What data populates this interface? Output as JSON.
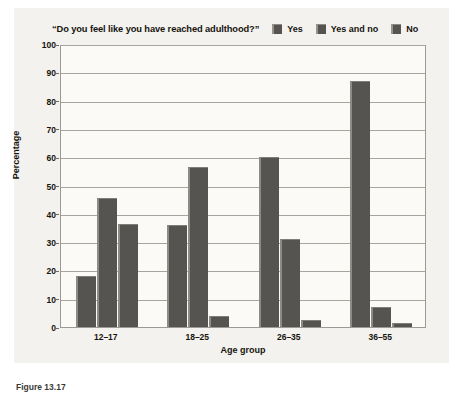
{
  "figure": {
    "caption": "Figure 13.17",
    "background_color": "#f3f2ee",
    "plot_background_color": "#fbfaf7",
    "bar_color": "#565451",
    "grid_color": "#a8a5a0"
  },
  "chart_data": {
    "type": "bar",
    "title": "“Do you feel like you have reached adulthood?”",
    "xlabel": "Age group",
    "ylabel": "Percentage",
    "ylim": [
      0,
      100
    ],
    "yticks": [
      0,
      10,
      20,
      30,
      40,
      50,
      60,
      70,
      80,
      90,
      100
    ],
    "ytick_labels": [
      "0",
      "10",
      "20",
      "30",
      "40",
      "50",
      "60",
      "70",
      "80",
      "90",
      "100"
    ],
    "grid": true,
    "grid_axis": "y",
    "legend_position": "top-right",
    "categories": [
      "12–17",
      "18–25",
      "26–35",
      "36–55"
    ],
    "series": [
      {
        "name": "Yes",
        "values": [
          18,
          36,
          60,
          87
        ]
      },
      {
        "name": "Yes and no",
        "values": [
          45.5,
          56.5,
          31,
          7
        ]
      },
      {
        "name": "No",
        "values": [
          36.5,
          4,
          2.5,
          1.5
        ]
      }
    ]
  }
}
